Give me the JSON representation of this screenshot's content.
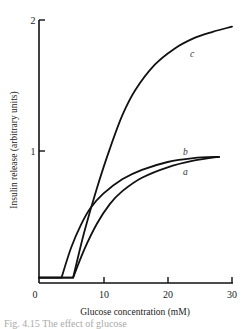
{
  "chart_data": {
    "type": "line",
    "title": "",
    "xlabel": "Glucose concentration (mM)",
    "ylabel": "Insulin release (arbitrary units)",
    "xlim": [
      0,
      30
    ],
    "ylim": [
      0,
      2
    ],
    "x_ticks": [
      "0",
      "10",
      "20",
      "30"
    ],
    "y_ticks": [
      "1",
      "2"
    ],
    "grid": false,
    "legend": "inline curve labels",
    "series": [
      {
        "name": "a",
        "x": [
          0,
          5.3,
          7,
          9,
          11,
          13,
          16,
          20,
          24,
          28
        ],
        "y": [
          0.04,
          0.04,
          0.25,
          0.45,
          0.6,
          0.7,
          0.8,
          0.88,
          0.93,
          0.96
        ]
      },
      {
        "name": "b",
        "x": [
          0,
          3.5,
          5,
          6.5,
          8,
          10,
          13,
          16,
          20,
          24,
          28
        ],
        "y": [
          0.04,
          0.04,
          0.27,
          0.44,
          0.57,
          0.68,
          0.79,
          0.86,
          0.92,
          0.95,
          0.96
        ]
      },
      {
        "name": "c",
        "x": [
          0,
          5.3,
          7,
          9,
          11,
          13,
          15,
          18,
          21,
          24,
          27,
          30
        ],
        "y": [
          0.04,
          0.04,
          0.38,
          0.72,
          1.02,
          1.28,
          1.47,
          1.66,
          1.78,
          1.86,
          1.91,
          1.95
        ]
      }
    ]
  },
  "caption": "Fig. 4.15 The effect of glucose"
}
